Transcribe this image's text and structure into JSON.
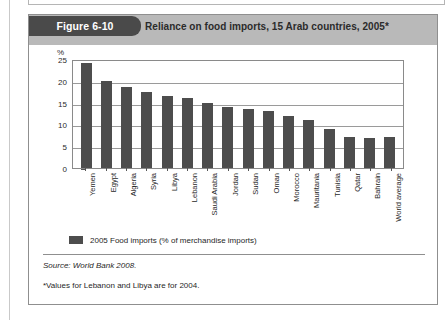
{
  "figure": {
    "tab_label": "Figure 6-10",
    "title": "Reliance on food imports, 15 Arab countries, 2005*",
    "source": "Source: World Bank 2008.",
    "note": "*Values for Lebanon and Libya are for 2004.",
    "colors": {
      "bar": "#4d4d4d",
      "header_band": "#b9b9b9",
      "tab": "#4a4a4a",
      "frame": "#8f8f8f",
      "gridline": "#9a9a9a"
    }
  },
  "chart_data": {
    "type": "bar",
    "title": "Reliance on food imports, 15 Arab countries, 2005*",
    "xlabel": "",
    "ylabel": "%",
    "ylim": [
      0,
      25
    ],
    "yticks": [
      0,
      5,
      10,
      15,
      20,
      25
    ],
    "grid": true,
    "legend_position": "below",
    "series": [
      {
        "name": "2005 Food imports (% of merchandise imports)",
        "color": "#4d4d4d",
        "values": [
          24,
          20,
          18.5,
          17.5,
          16.5,
          16,
          15,
          14,
          13.5,
          13,
          12,
          11,
          9,
          7,
          6.8,
          7
        ]
      }
    ],
    "categories": [
      "Yemen",
      "Egypt",
      "Algeria",
      "Syria",
      "Libya",
      "Lebanon",
      "Saudi Arabia",
      "Jordan",
      "Sudan",
      "Oman",
      "Morocco",
      "Mauritania",
      "Tunisia",
      "Qatar",
      "Bahrain",
      "World average"
    ]
  }
}
